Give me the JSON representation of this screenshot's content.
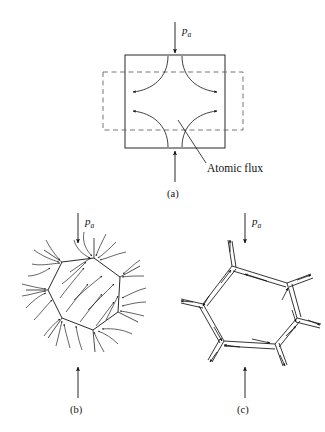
{
  "figure": {
    "background_color": "#ffffff",
    "line_color": "#1a1a1a",
    "dashed_color": "#555555"
  },
  "panels": [
    {
      "id": "a",
      "caption": "(a)",
      "pressure_label": "p",
      "pressure_subscript": "a",
      "annotation": "Atomic flux",
      "description": "Square grain with dashed rectangle overlay and four curved atomic flux paths"
    },
    {
      "id": "b",
      "caption": "(b)",
      "pressure_label": "p",
      "pressure_subscript": "a",
      "description": "Hexagonal grain with dense curved flux streamlines converging on grain boundaries"
    },
    {
      "id": "c",
      "caption": "(c)",
      "pressure_label": "p",
      "pressure_subscript": "a",
      "description": "Polygonal grain boundary network drawn as double lines with directional flux arrows"
    }
  ],
  "labels": {
    "pa_a": "p",
    "pa_a_sub": "a",
    "pa_b": "p",
    "pa_b_sub": "a",
    "pa_c": "p",
    "pa_c_sub": "a",
    "caption_a": "(a)",
    "caption_b": "(b)",
    "caption_c": "(c)",
    "atomic_flux": "Atomic flux"
  }
}
